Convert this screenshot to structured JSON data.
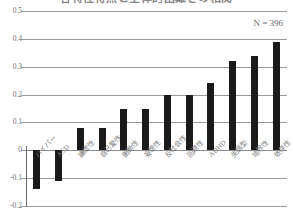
{
  "chart_data": {
    "type": "bar",
    "title": "各特性得点と全体的困難さの相関",
    "subtitle": "",
    "xlabel": "",
    "ylabel": "",
    "ylim": [
      -0.2,
      0.5
    ],
    "yticks": [
      0.5,
      0.4,
      0.3,
      0.2,
      0.1,
      0,
      -0.1,
      -0.2
    ],
    "ytick_labels": [
      "0.5",
      "0.4",
      "0.3",
      "0.2",
      "0.1",
      "0",
      "-0.1",
      "-0.2"
    ],
    "grid": true,
    "legend": false,
    "annotations": [
      {
        "name": "sample-size",
        "text": "N = 396"
      }
    ],
    "categories": [
      "ハイパー",
      "ASD",
      "謙虚性",
      "自己愛性",
      "衝動性",
      "妄想性",
      "反社会性",
      "回避性",
      "ADHD",
      "失調型",
      "境界性",
      "依存性"
    ],
    "values": [
      -0.14,
      -0.11,
      0.08,
      0.08,
      0.15,
      0.15,
      0.2,
      0.2,
      0.24,
      0.32,
      0.34,
      0.39
    ],
    "bar_color": "#1a1a1a",
    "grid_color": "#9a9a9a"
  }
}
